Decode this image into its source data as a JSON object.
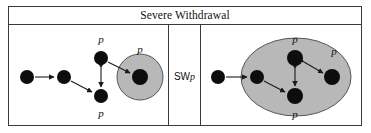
{
  "figure": {
    "title": "Severe Withdrawal",
    "operator": {
      "prefix": "SW",
      "variable": "p"
    },
    "colors": {
      "region_fill": "#b8b8b8",
      "region_stroke": "#555555",
      "node_fill": "#0d0d0d",
      "edge_stroke": "#1a1a1a",
      "border": "#3a3a3a",
      "background": "#ffffff"
    },
    "left_panel": {
      "name": "before-graph",
      "nodes": [
        {
          "id": "n1",
          "cx": 18,
          "cy": 52,
          "r": 7,
          "label": ""
        },
        {
          "id": "n2",
          "cx": 55,
          "cy": 52,
          "r": 7,
          "label": ""
        },
        {
          "id": "n3",
          "cx": 92,
          "cy": 33,
          "r": 7,
          "label": "p"
        },
        {
          "id": "n4",
          "cx": 92,
          "cy": 71,
          "r": 7,
          "label": "p"
        },
        {
          "id": "n5",
          "cx": 131,
          "cy": 52,
          "r": 8,
          "label": "p"
        }
      ],
      "region": {
        "type": "circle",
        "cx": 131,
        "cy": 52,
        "r": 23
      },
      "edges": [
        {
          "from": "n1",
          "to": "n2",
          "arrow": "single"
        },
        {
          "from": "n2",
          "to": "n4",
          "arrow": "single"
        },
        {
          "from": "n3",
          "to": "n5",
          "arrow": "single"
        },
        {
          "from": "n3",
          "to": "n4",
          "arrow": "double"
        }
      ],
      "labels": [
        {
          "text": "p",
          "x": 92,
          "y": 18
        },
        {
          "text": "p",
          "x": 92,
          "y": 92
        },
        {
          "text": "p",
          "x": 131,
          "y": 28
        }
      ]
    },
    "right_panel": {
      "name": "after-graph",
      "nodes": [
        {
          "id": "m1",
          "cx": 17,
          "cy": 52,
          "r": 7,
          "label": ""
        },
        {
          "id": "m2",
          "cx": 56,
          "cy": 52,
          "r": 7,
          "label": ""
        },
        {
          "id": "m3",
          "cx": 94,
          "cy": 33,
          "r": 8,
          "label": "p"
        },
        {
          "id": "m4",
          "cx": 94,
          "cy": 71,
          "r": 8,
          "label": "p"
        },
        {
          "id": "m5",
          "cx": 131,
          "cy": 52,
          "r": 8,
          "label": "p"
        }
      ],
      "region": {
        "type": "ellipse",
        "cx": 95,
        "cy": 52,
        "rx": 55,
        "ry": 39
      },
      "edges": [
        {
          "from": "m1",
          "to": "m2",
          "arrow": "single"
        },
        {
          "from": "m2",
          "to": "m4",
          "arrow": "single"
        },
        {
          "from": "m3",
          "to": "m4",
          "arrow": "double"
        },
        {
          "from": "m3",
          "to": "m5",
          "arrow": "double"
        }
      ],
      "labels": [
        {
          "text": "p",
          "x": 94,
          "y": 18
        },
        {
          "text": "p",
          "x": 94,
          "y": 93
        },
        {
          "text": "p",
          "x": 133,
          "y": 30
        }
      ]
    }
  }
}
